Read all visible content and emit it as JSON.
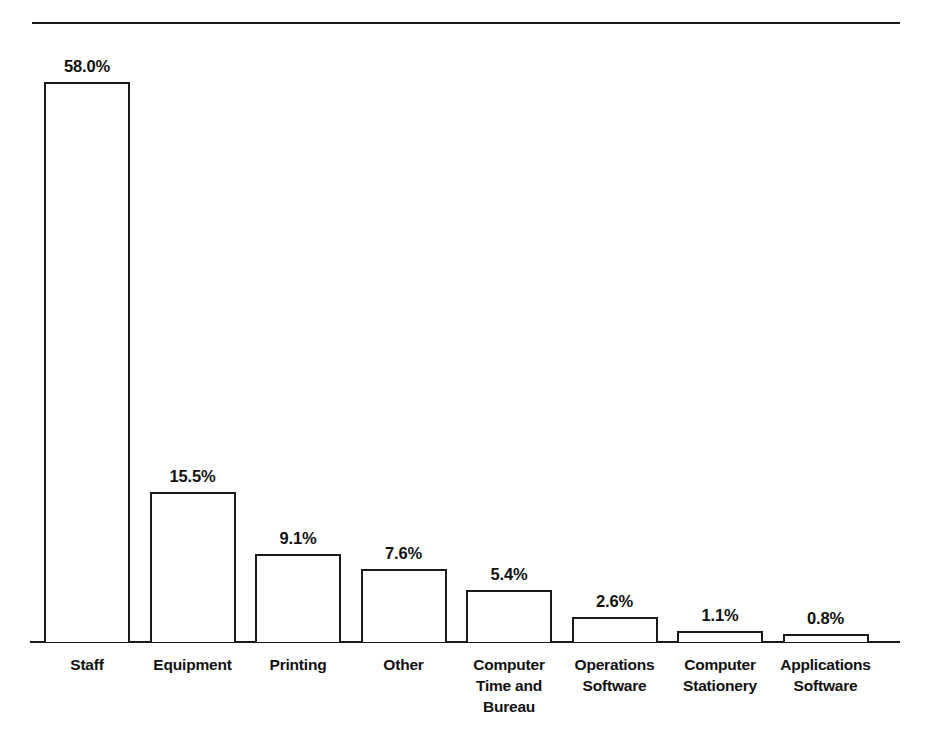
{
  "chart_data": {
    "type": "bar",
    "title": "",
    "subtitle": "",
    "xlabel": "",
    "ylabel": "",
    "ylim": [
      0,
      58.0
    ],
    "grid": false,
    "legend": false,
    "orientation": "vertical",
    "bar_style": "outlined-unfilled",
    "value_suffix": "%",
    "categories": [
      "Staff",
      "Equipment",
      "Printing",
      "Other",
      "Computer Time and Bureau",
      "Operations Software",
      "Computer Stationery",
      "Applications Software"
    ],
    "category_lines": [
      [
        "Staff"
      ],
      [
        "Equipment"
      ],
      [
        "Printing"
      ],
      [
        "Other"
      ],
      [
        "Computer",
        "Time and",
        "Bureau"
      ],
      [
        "Operations",
        "Software"
      ],
      [
        "Computer",
        "Stationery"
      ],
      [
        "Applications",
        "Software"
      ]
    ],
    "values": [
      58.0,
      15.5,
      9.1,
      7.6,
      5.4,
      2.6,
      1.1,
      0.8
    ],
    "value_labels": [
      "58.0%",
      "15.5%",
      "9.1%",
      "7.6%",
      "5.4%",
      "2.6%",
      "1.1%",
      "0.8%"
    ],
    "colors": {
      "bar_outline": "#1a1a1a",
      "bar_fill": "#ffffff",
      "axis": "#1a1a1a",
      "text": "#111111",
      "background": "#ffffff"
    }
  },
  "decorations": {
    "top_rule": "horizontal-rule"
  }
}
